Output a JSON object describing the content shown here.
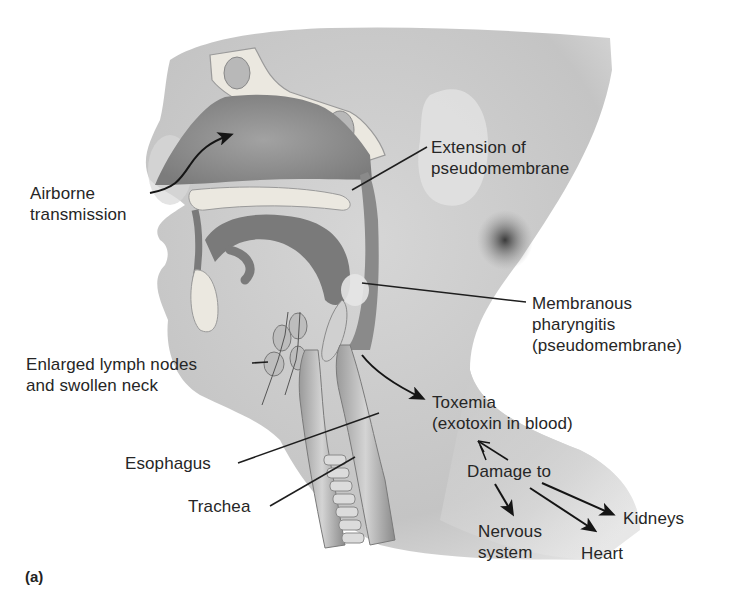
{
  "figure": {
    "panel_label": "(a)",
    "colors": {
      "skin": "#c9c9c9",
      "skin_light": "#dcdcdc",
      "cavity": "#8e8e8e",
      "bone": "#e8e6e0",
      "tissue_dark": "#7a7a7a",
      "leader": "#1e1e1e",
      "text": "#262626"
    }
  },
  "labels": {
    "airborne": {
      "line1": "Airborne",
      "line2": "transmission"
    },
    "extension": {
      "line1": "Extension of",
      "line2": "pseudomembrane"
    },
    "membranous": {
      "line1": "Membranous",
      "line2": "pharyngitis",
      "line3": "(pseudomembrane)"
    },
    "lymph": {
      "line1": "Enlarged lymph nodes",
      "line2": "and swollen neck"
    },
    "toxemia": {
      "line1": "Toxemia",
      "line2": "(exotoxin in blood)"
    },
    "damage": {
      "text": "Damage to"
    },
    "esophagus": {
      "text": "Esophagus"
    },
    "trachea": {
      "text": "Trachea"
    },
    "kidneys": {
      "text": "Kidneys"
    },
    "nervous": {
      "line1": "Nervous",
      "line2": "system"
    },
    "heart": {
      "text": "Heart"
    }
  }
}
